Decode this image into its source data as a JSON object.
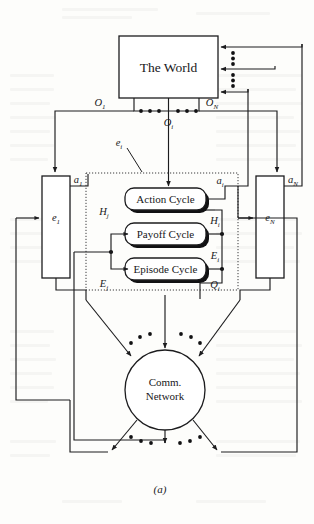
{
  "figure": {
    "caption": "(a)"
  },
  "world": {
    "label": "The World",
    "incoming_arrow_count": 3,
    "dot_columns": 2,
    "dots_per_column": 3
  },
  "observations": {
    "first": {
      "base": "O",
      "sub": "1"
    },
    "middle": {
      "base": "O",
      "sub": "i"
    },
    "last": {
      "base": "O",
      "sub": "N"
    },
    "dot_count": 6
  },
  "actions": {
    "first": {
      "base": "a",
      "sub": "1"
    },
    "middle": {
      "base": "a",
      "sub": "i"
    },
    "last": {
      "base": "a",
      "sub": "N"
    }
  },
  "agents": {
    "left": {
      "base": "e",
      "sub": "1"
    },
    "right": {
      "base": "e",
      "sub": "N"
    },
    "center": {
      "base": "e",
      "sub": "i"
    }
  },
  "cycles": [
    {
      "label": "Action Cycle",
      "name": "action-cycle"
    },
    {
      "label": "Payoff Cycle",
      "name": "payoff-cycle"
    },
    {
      "label": "Episode Cycle",
      "name": "episode-cycle"
    }
  ],
  "inputs": {
    "history": {
      "base": "H",
      "sub": "j"
    },
    "episode": {
      "base": "E",
      "sub": "j"
    }
  },
  "outputs": {
    "history": {
      "base": "H",
      "sub": "i"
    },
    "episode": {
      "base": "E",
      "sub": "i"
    },
    "quality": {
      "base": "Q",
      "sub": "i"
    }
  },
  "network": {
    "line1": "Comm.",
    "line2": "Network",
    "incoming_arrows": 3,
    "outgoing_arrows": 3,
    "dot_groups_top": 2,
    "dot_groups_bottom": 2
  },
  "colors": {
    "ink": "#1c1c1e",
    "paper": "#fdfdfb",
    "shadow": "#111113",
    "dotted": "#3a3a3c"
  }
}
